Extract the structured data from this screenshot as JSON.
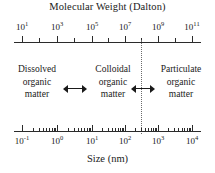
{
  "figure": {
    "top_axis_title": "Molecular Weight (Dalton)",
    "bottom_axis_title": "Size (nm)",
    "divider_label": "boundary between colloidal and particulate organic matter"
  },
  "top_axis": {
    "labels": [
      "10¹",
      "10³",
      "10⁵",
      "10⁷",
      "10⁹",
      "10¹¹"
    ],
    "label_bases": [
      "10",
      "10",
      "10",
      "10",
      "10",
      "10"
    ],
    "label_exponents": [
      "1",
      "3",
      "5",
      "7",
      "9",
      "11"
    ],
    "positions_px": [
      22,
      57,
      92,
      125,
      158,
      192
    ],
    "minor_positions_px": [
      39,
      74,
      108,
      141,
      175
    ]
  },
  "bottom_axis": {
    "labels": [
      "10⁻¹",
      "10⁰",
      "10¹",
      "10²",
      "10³",
      "10⁴"
    ],
    "label_bases": [
      "10",
      "10",
      "10",
      "10",
      "10",
      "10"
    ],
    "label_exponents": [
      "-1",
      "0",
      "1",
      "2",
      "3",
      "4"
    ],
    "positions_px": [
      22,
      57,
      92,
      125,
      158,
      192
    ],
    "decades": 5,
    "minor_log_fractions": [
      0.301,
      0.477,
      0.602,
      0.699,
      0.778,
      0.845,
      0.903,
      0.954
    ]
  },
  "categories": [
    {
      "line1": "Dissolved",
      "line2": "organic",
      "line3": "matter"
    },
    {
      "line1": "Colloidal",
      "line2": "organic",
      "line3": "matter"
    },
    {
      "line1": "Particulate",
      "line2": "organic",
      "line3": "matter"
    }
  ],
  "arrows": [
    {
      "name": "dissolved-colloidal-divider",
      "kind": "double-headed"
    },
    {
      "name": "colloidal-particulate-divider",
      "kind": "double-headed"
    }
  ],
  "chart_data": {
    "type": "table",
    "title": "Molecular Weight (Dalton)",
    "xlabel": "Size (nm)",
    "ylabel": "",
    "grid": false,
    "legend": "none",
    "axes": [
      {
        "name": "Molecular Weight (Dalton)",
        "position": "top",
        "scale": "log",
        "tick_labels": [
          "10^1",
          "10^3",
          "10^5",
          "10^7",
          "10^9",
          "10^11"
        ],
        "range": [
          "10^0",
          "10^11.5"
        ]
      },
      {
        "name": "Size (nm)",
        "position": "bottom",
        "scale": "log",
        "tick_labels": [
          "10^-1",
          "10^0",
          "10^1",
          "10^2",
          "10^3",
          "10^4"
        ],
        "range": [
          "10^-1.3",
          "10^4.4"
        ]
      }
    ],
    "categories": [
      "Dissolved organic matter",
      "Colloidal organic matter",
      "Particulate organic matter"
    ],
    "annotations": [
      "Dissolved organic matter",
      "Colloidal organic matter",
      "Particulate organic matter"
    ],
    "divider_lines": [
      "dotted vertical line separating colloidal from particulate organic matter"
    ]
  }
}
